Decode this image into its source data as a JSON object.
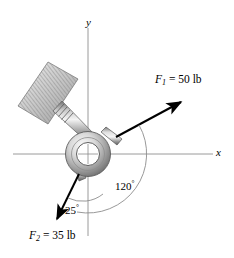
{
  "figure": {
    "background_color": "#ffffff",
    "line_color": "#000000",
    "axis_color": "#808080",
    "metal_light": "#f2f2f2",
    "metal_mid": "#b8b8b8",
    "metal_dark": "#6e6e6e",
    "hatch_color": "#8c8c8c"
  },
  "axes": {
    "x_label": "x",
    "y_label": "y",
    "origin": {
      "x": 88,
      "y": 154
    }
  },
  "forces": [
    {
      "id": "F1",
      "symbol": "F",
      "subscript": "1",
      "equals": "=",
      "magnitude": "50",
      "unit": "lb",
      "label": "F₁ = 50 lb",
      "direction_deg_from_x": 30,
      "tail": {
        "x": 116,
        "y": 137
      },
      "head": {
        "x": 184,
        "y": 100
      }
    },
    {
      "id": "F2",
      "symbol": "F",
      "subscript": "2",
      "equals": "=",
      "magnitude": "35",
      "unit": "lb",
      "label": "F₂ = 35 lb",
      "direction_deg_from_x": -115,
      "tail": {
        "x": 79,
        "y": 174
      },
      "head": {
        "x": 55,
        "y": 223
      }
    }
  ],
  "angles": [
    {
      "id": "angle-120",
      "value": "120",
      "symbol": "°",
      "label": "120°",
      "between": "F1-to-F2"
    },
    {
      "id": "angle-25",
      "value": "25",
      "symbol": "°",
      "label": "25°",
      "between": "F2-to-negative-y"
    }
  ],
  "components": {
    "ring": {
      "center_x": 88,
      "center_y": 154,
      "outer_r": 22,
      "inner_r": 11
    },
    "wall_support": "hatched-fixed-support",
    "rod": "threaded-rod"
  }
}
